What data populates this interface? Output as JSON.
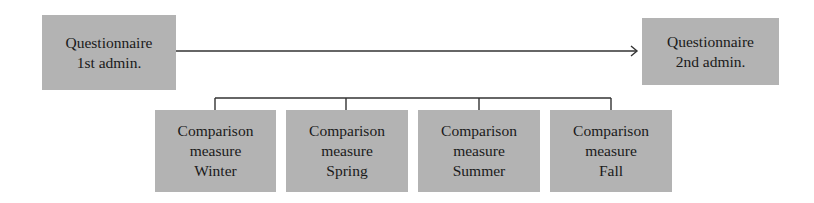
{
  "diagram": {
    "top": {
      "first": {
        "lines": [
          "Questionnaire",
          "1st admin."
        ]
      },
      "second": {
        "lines": [
          "Questionnaire",
          "2nd admin."
        ]
      }
    },
    "comparisons": [
      {
        "lines": [
          "Comparison",
          "measure",
          "Winter"
        ]
      },
      {
        "lines": [
          "Comparison",
          "measure",
          "Spring"
        ]
      },
      {
        "lines": [
          "Comparison",
          "measure",
          "Summer"
        ]
      },
      {
        "lines": [
          "Comparison",
          "measure",
          "Fall"
        ]
      }
    ],
    "colors": {
      "box_fill": "#b3b3b3",
      "line": "#333333",
      "text": "#1a1a1a"
    }
  }
}
